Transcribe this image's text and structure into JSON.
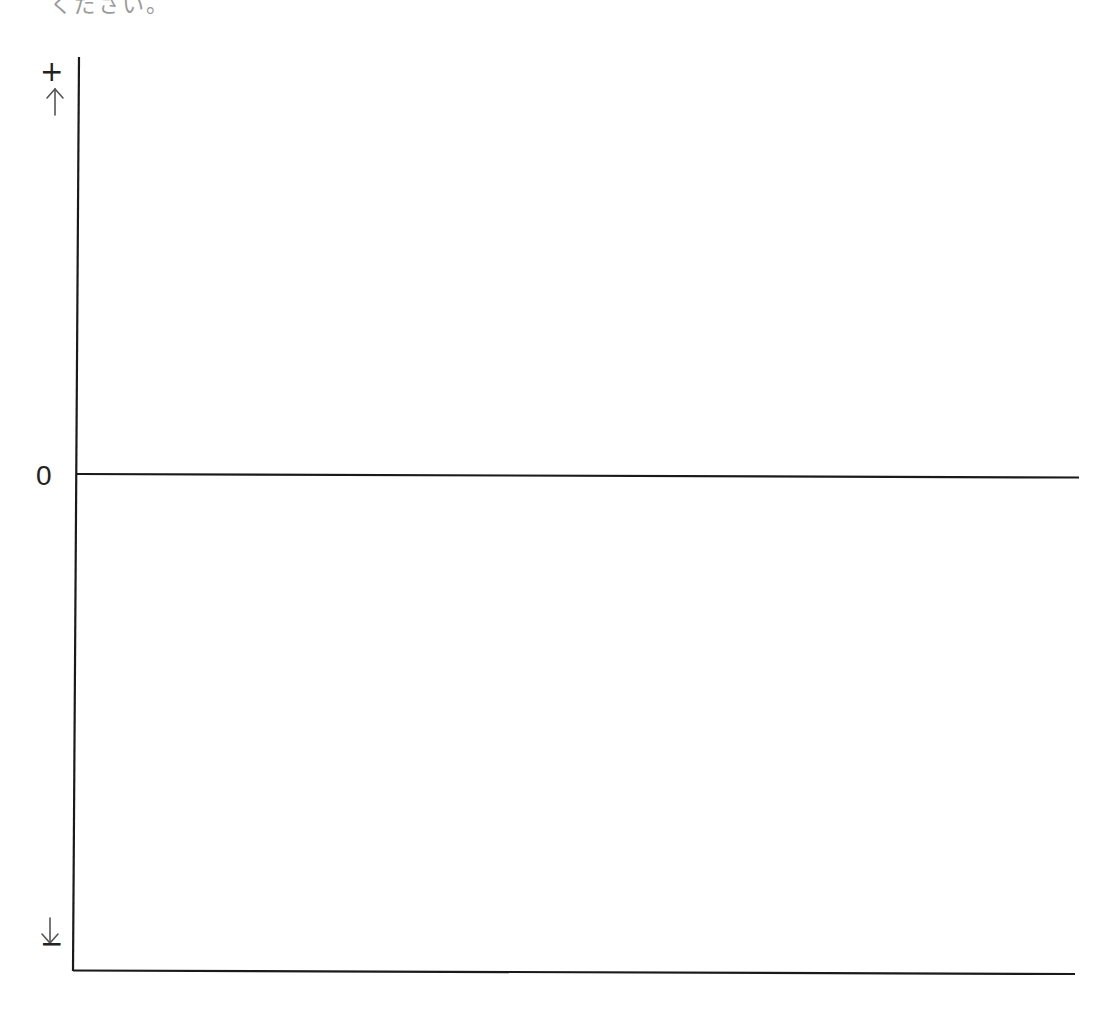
{
  "caption": {
    "clipped_text": "ください。"
  },
  "diagram": {
    "type": "signed-axis-diagram",
    "y_axis": {
      "top_label": "+",
      "zero_label": "0",
      "bottom_label": "−",
      "up_arrow": "↑",
      "down_arrow": "↓"
    },
    "lines": {
      "zero_line": "horizontal baseline at 0",
      "bottom_line": "horizontal baseline at bottom"
    },
    "colors": {
      "line": "#1a1a1a",
      "arrow": "#555555",
      "background": "#ffffff"
    }
  }
}
